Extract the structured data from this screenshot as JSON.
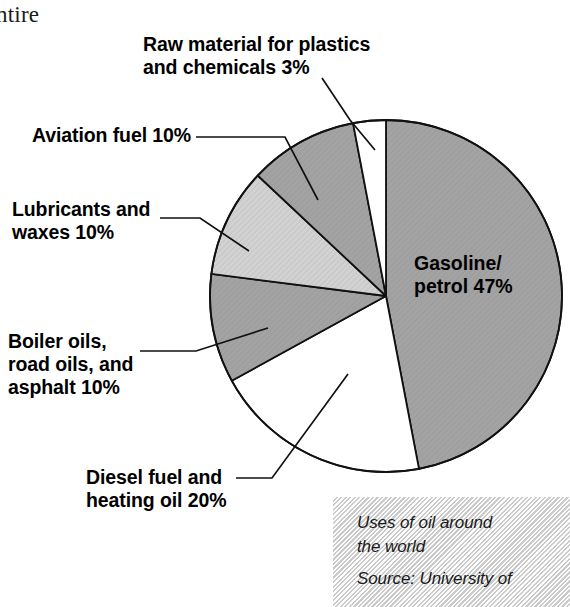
{
  "page": {
    "body_text_fragment": "ntire",
    "width": 570,
    "height": 607
  },
  "chart_data": {
    "type": "pie",
    "title": "Uses of oil around the world",
    "source": "Source: University of",
    "units": "percent",
    "start_angle_deg": 0,
    "direction": "clockwise",
    "center": [
      386,
      296
    ],
    "radius": 176,
    "categories": [
      "Gasoline/petrol",
      "Diesel fuel and heating oil",
      "Boiler oils, road oils, and asphalt",
      "Lubricants and waxes",
      "Aviation fuel",
      "Raw material for plastics and chemicals"
    ],
    "values": [
      47,
      20,
      10,
      10,
      10,
      3
    ],
    "slices": [
      {
        "label": "Gasoline/petrol 47%",
        "name": "Gasoline/petrol",
        "value": 47,
        "fill": "#a3a3a3",
        "hatch": true,
        "label_placement": "inside"
      },
      {
        "label": "Diesel fuel and heating oil 20%",
        "name": "Diesel fuel and heating oil",
        "value": 20,
        "fill": "#ffffff",
        "hatch": false,
        "label_placement": "callout"
      },
      {
        "label": "Boiler oils, road oils, and asphalt 10%",
        "name": "Boiler oils, road oils, and asphalt",
        "value": 10,
        "fill": "#a3a3a3",
        "hatch": true,
        "label_placement": "callout"
      },
      {
        "label": "Lubricants and waxes 10%",
        "name": "Lubricants and waxes",
        "value": 10,
        "fill": "#cdcdcd",
        "hatch": true,
        "label_placement": "callout"
      },
      {
        "label": "Aviation fuel 10%",
        "name": "Aviation fuel",
        "value": 10,
        "fill": "#a3a3a3",
        "hatch": true,
        "label_placement": "callout"
      },
      {
        "label": "Raw material for plastics and chemicals 3%",
        "name": "Raw material for plastics and chemicals",
        "value": 3,
        "fill": "#ffffff",
        "hatch": false,
        "label_placement": "callout"
      }
    ],
    "legend": "none",
    "grid": false
  },
  "labels": {
    "raw_material": "Raw material for plastics\nand chemicals 3%",
    "aviation_fuel": "Aviation fuel 10%",
    "lubricants": "Lubricants and\nwaxes 10%",
    "boiler_oils": "Boiler oils,\nroad oils, and\nasphalt 10%",
    "diesel_fuel": "Diesel fuel and\nheating oil 20%",
    "gasoline": "Gasoline/\npetrol 47%"
  },
  "caption": {
    "title": "Uses of oil around\nthe world",
    "source": "Source: University of"
  },
  "colors": {
    "slice_dark_gray": "#a3a3a3",
    "slice_light_gray": "#cdcdcd",
    "slice_white": "#ffffff",
    "outline": "#111111",
    "text": "#000000",
    "caption_background": "#eeeeee"
  }
}
